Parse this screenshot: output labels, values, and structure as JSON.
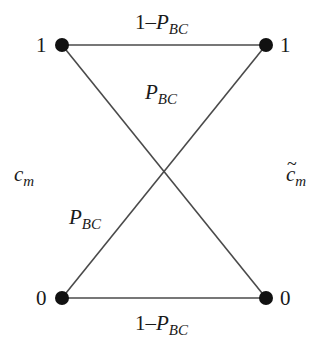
{
  "diagram": {
    "type": "binary-symmetric-channel",
    "colors": {
      "line": "#4a4a4a",
      "node": "#111111",
      "text": "#1a1a1a"
    },
    "left_label": {
      "var": "c",
      "sub": "m"
    },
    "right_label": {
      "tilde": "~",
      "var": "c",
      "sub": "m"
    },
    "nodes": {
      "left_top": {
        "label": "1"
      },
      "right_top": {
        "label": "1"
      },
      "left_bottom": {
        "label": "0"
      },
      "right_bottom": {
        "label": "0"
      }
    },
    "edges": {
      "top": {
        "prefix": "1–",
        "var": "P",
        "sub": "BC"
      },
      "bottom": {
        "prefix": "1–",
        "var": "P",
        "sub": "BC"
      },
      "cross_top": {
        "var": "P",
        "sub": "BC"
      },
      "cross_left": {
        "var": "P",
        "sub": "BC"
      }
    }
  }
}
